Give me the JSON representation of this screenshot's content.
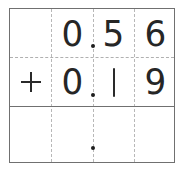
{
  "worksheet": {
    "type": "decimal-addition-grid",
    "columns": 4,
    "rows": [
      {
        "role": "addend-1",
        "cells": [
          "",
          "0",
          "5",
          "6"
        ],
        "decimal_point": true
      },
      {
        "role": "addend-2",
        "cells": [
          "+",
          "0",
          "1",
          "9"
        ],
        "decimal_point": true
      },
      {
        "role": "answer",
        "cells": [
          "",
          "",
          "",
          ""
        ],
        "decimal_point": true
      }
    ],
    "operator": "+",
    "line_color": "#707070",
    "guide_color": "#b8b8b8",
    "ink_color": "#2a2a2a"
  }
}
